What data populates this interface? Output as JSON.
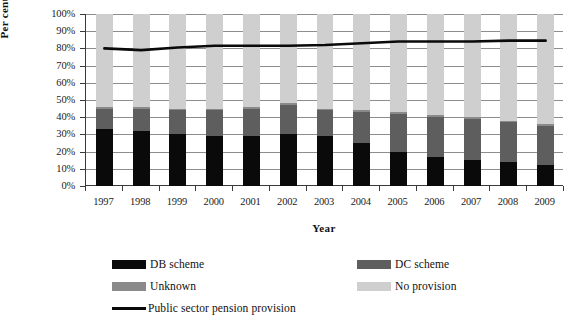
{
  "chart_data": {
    "type": "bar",
    "stacked": true,
    "title": "",
    "xlabel": "Year",
    "ylabel": "Per cent",
    "ylim": [
      0,
      100
    ],
    "ytick_step": 10,
    "ytick_labels": [
      "0%",
      "10%",
      "20%",
      "30%",
      "40%",
      "50%",
      "60%",
      "70%",
      "80%",
      "90%",
      "100%"
    ],
    "grid": true,
    "legend_position": "bottom",
    "categories": [
      "1997",
      "1998",
      "1999",
      "2000",
      "2001",
      "2002",
      "2003",
      "2004",
      "2005",
      "2006",
      "2007",
      "2008",
      "2009"
    ],
    "series": [
      {
        "name": "DB scheme",
        "color": "#0a0a0a",
        "values": [
          33,
          32,
          30,
          29,
          29,
          30,
          29,
          25,
          20,
          17,
          15,
          14,
          12
        ]
      },
      {
        "name": "DC scheme",
        "color": "#5e5e5e",
        "values": [
          12,
          13,
          14,
          15,
          16,
          17,
          15,
          18,
          22,
          23,
          24,
          23,
          23
        ]
      },
      {
        "name": "Unknown",
        "color": "#8a8a8a",
        "values": [
          1,
          1,
          1,
          1,
          1,
          1,
          1,
          1,
          1,
          1,
          1,
          1,
          1
        ]
      },
      {
        "name": "No provision",
        "color": "#cfcfcf",
        "values": [
          54,
          54,
          55,
          55,
          54,
          52,
          55,
          56,
          57,
          59,
          60,
          62,
          64
        ]
      }
    ],
    "line_series": {
      "name": "Public sector pension provision",
      "color": "#0a0a0a",
      "values": [
        80,
        79,
        80.5,
        81.5,
        81.5,
        81.5,
        82,
        83,
        84,
        84,
        84,
        84.5,
        84.5
      ]
    }
  },
  "axes": {
    "y_title": "Per cent",
    "x_title": "Year"
  },
  "legend": {
    "row1": [
      {
        "label": "DB scheme",
        "color": "#0a0a0a",
        "marker": "swatch"
      },
      {
        "label": "DC scheme",
        "color": "#5e5e5e",
        "marker": "swatch"
      }
    ],
    "row2": [
      {
        "label": "Unknown",
        "color": "#8a8a8a",
        "marker": "swatch"
      },
      {
        "label": "No provision",
        "color": "#cfcfcf",
        "marker": "swatch"
      }
    ],
    "row3": [
      {
        "label": "Public sector pension provision",
        "color": "#0a0a0a",
        "marker": "line"
      }
    ]
  }
}
